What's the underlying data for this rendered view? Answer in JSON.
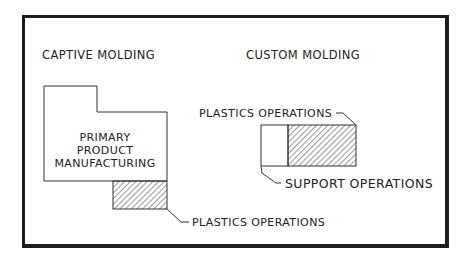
{
  "diagram": {
    "sections": [
      {
        "id": "captive",
        "title": "CAPTIVE MOLDING",
        "main_block_label": [
          "PRIMARY",
          "PRODUCT",
          "MANUFACTURING"
        ],
        "hatched_label": "PLASTICS OPERATIONS"
      },
      {
        "id": "custom",
        "title": "CUSTOM MOLDING",
        "hatched_label": "PLASTICS OPERATIONS",
        "plain_label": "SUPPORT OPERATIONS"
      }
    ],
    "colors": {
      "line": "#222222",
      "frame": "#1c1c1c",
      "background": "#ffffff"
    }
  }
}
